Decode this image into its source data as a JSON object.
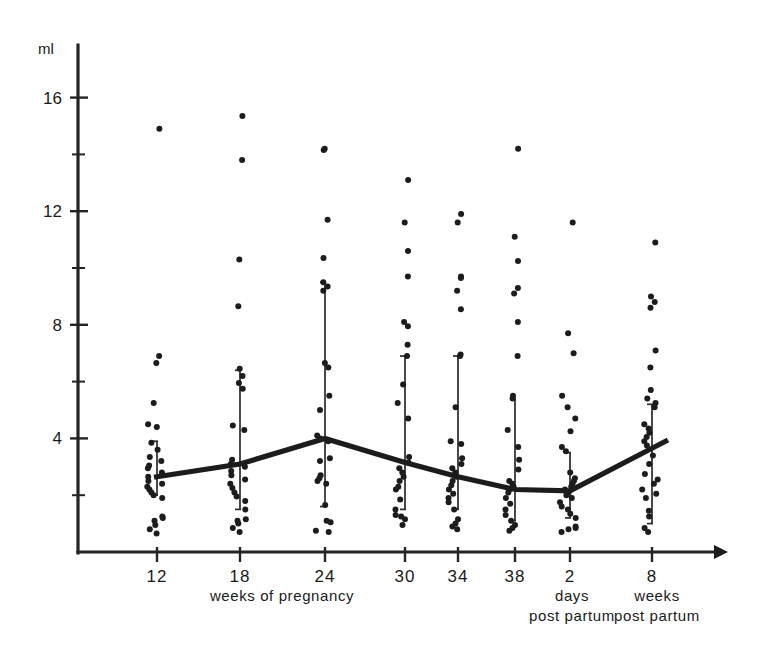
{
  "chart_data": {
    "type": "scatter",
    "title": "",
    "xlabel": "weeks of pregnancy",
    "ylabel": "ml",
    "ylim": [
      0,
      17.8
    ],
    "yticks_major": [
      4,
      8,
      12,
      16
    ],
    "yticks_major_labels": [
      "4",
      "8",
      "12",
      "16"
    ],
    "yticks_minor": [
      2,
      6,
      10,
      14
    ],
    "grid": false,
    "legend": "none",
    "x_categories": [
      "12",
      "18",
      "24",
      "30",
      "34",
      "38",
      "2",
      "8"
    ],
    "x_tick_labels": [
      "12",
      "18",
      "24",
      "30",
      "34",
      "38",
      "2",
      "8"
    ],
    "group_captions": [
      {
        "label": "weeks of pregnancy",
        "spans": [
          "12",
          "18",
          "24",
          "30",
          "34",
          "38"
        ]
      },
      {
        "label_line1": "days",
        "label_line2": "post partum",
        "spans": [
          "2"
        ]
      },
      {
        "label_line1": "weeks",
        "label_line2": "post partum",
        "spans": [
          "8"
        ]
      }
    ],
    "series": [
      {
        "name": "mean",
        "kind": "line",
        "categories": [
          "12",
          "18",
          "24",
          "30",
          "34",
          "38",
          "2",
          "8"
        ],
        "values": [
          2.65,
          3.1,
          4.0,
          3.15,
          2.65,
          2.2,
          2.15,
          3.65
        ]
      }
    ],
    "range_bars": [
      {
        "category": "12",
        "low": 2.0,
        "high": 3.9
      },
      {
        "category": "18",
        "low": 1.5,
        "high": 6.4
      },
      {
        "category": "24",
        "low": 1.6,
        "high": 9.5
      },
      {
        "category": "30",
        "low": 1.5,
        "high": 6.9
      },
      {
        "category": "34",
        "low": 1.5,
        "high": 6.9
      },
      {
        "category": "38",
        "low": 1.1,
        "high": 5.4
      },
      {
        "category": "2",
        "low": 1.2,
        "high": 3.5
      },
      {
        "category": "8",
        "low": 1.0,
        "high": 5.2
      }
    ],
    "points": {
      "12": [
        14.9,
        6.9,
        6.65,
        5.25,
        4.5,
        4.4,
        3.85,
        3.6,
        3.35,
        3.2,
        3.05,
        2.95,
        2.8,
        2.65,
        2.5,
        2.4,
        2.3,
        2.2,
        2.1,
        2.0,
        1.9,
        1.25,
        1.2,
        1.1,
        0.95,
        0.8,
        0.65
      ],
      "18": [
        15.35,
        13.8,
        10.3,
        8.65,
        6.45,
        6.2,
        5.95,
        5.75,
        4.45,
        4.3,
        3.25,
        3.1,
        3.0,
        2.85,
        2.7,
        2.55,
        2.4,
        2.25,
        2.1,
        1.95,
        1.8,
        1.5,
        1.15,
        1.1,
        1.0,
        0.85,
        0.7
      ],
      "24": [
        14.2,
        14.15,
        11.7,
        10.35,
        9.5,
        9.35,
        9.2,
        6.65,
        6.5,
        5.5,
        5.0,
        4.1,
        4.0,
        3.9,
        3.3,
        3.2,
        2.7,
        2.6,
        2.5,
        2.4,
        1.65,
        1.1,
        1.05,
        0.75,
        0.7
      ],
      "30": [
        13.1,
        11.6,
        10.6,
        9.7,
        8.1,
        7.95,
        7.3,
        6.9,
        5.9,
        5.25,
        4.7,
        3.35,
        3.15,
        2.95,
        2.8,
        2.65,
        2.5,
        2.3,
        2.2,
        1.85,
        1.5,
        1.3,
        1.25,
        1.15,
        0.95
      ],
      "34": [
        11.9,
        11.6,
        9.7,
        9.65,
        9.2,
        8.55,
        6.95,
        6.9,
        5.1,
        3.9,
        3.8,
        3.3,
        3.1,
        2.95,
        2.8,
        2.65,
        2.5,
        2.35,
        2.2,
        2.05,
        1.9,
        1.75,
        1.5,
        1.15,
        1.0,
        0.9,
        0.8
      ],
      "38": [
        14.2,
        11.1,
        10.25,
        9.3,
        9.1,
        8.1,
        6.9,
        5.5,
        5.4,
        4.3,
        3.7,
        3.25,
        2.9,
        2.5,
        2.4,
        2.3,
        2.2,
        2.1,
        1.9,
        1.7,
        1.5,
        1.3,
        1.1,
        0.95,
        0.85,
        0.75
      ],
      "2": [
        11.6,
        7.7,
        7.0,
        5.5,
        5.1,
        4.7,
        4.25,
        3.7,
        3.55,
        2.8,
        2.6,
        2.5,
        2.4,
        2.3,
        2.2,
        2.1,
        2.0,
        1.9,
        1.75,
        1.6,
        1.5,
        1.35,
        1.2,
        0.9,
        0.85,
        0.8,
        0.7
      ],
      "8": [
        10.9,
        9.0,
        8.8,
        8.6,
        7.1,
        6.5,
        5.7,
        5.4,
        5.25,
        5.1,
        4.5,
        4.35,
        4.2,
        4.05,
        3.9,
        3.75,
        3.4,
        3.1,
        2.75,
        2.55,
        2.4,
        2.2,
        2.05,
        1.9,
        1.45,
        1.25,
        0.85,
        0.7
      ]
    }
  },
  "axes": {
    "y_unit_label": "ml",
    "y_tick_labels": [
      "16",
      "12",
      "8",
      "4"
    ],
    "x_tick_labels": [
      "12",
      "18",
      "24",
      "30",
      "34",
      "38",
      "2",
      "8"
    ]
  },
  "captions": {
    "pregnancy": "weeks of pregnancy",
    "days_line1": "days",
    "days_line2": "post partum",
    "weeks_line1": "weeks",
    "weeks_line2": "post partum"
  },
  "colors": {
    "ink": "#1c1c1c",
    "axis": "#242424",
    "background": "#ffffff"
  }
}
